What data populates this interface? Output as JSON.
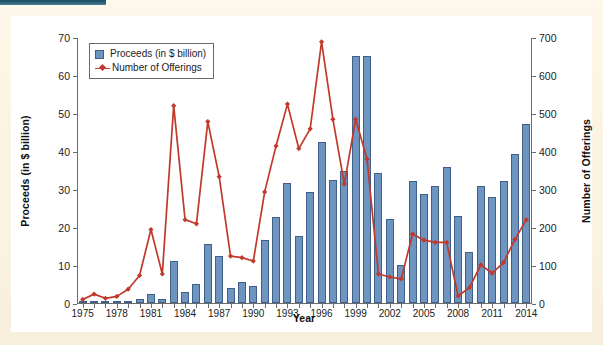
{
  "figure": {
    "background_color": "#ffffff",
    "page_background_color": "#fbf5e4",
    "top_tab_color": "#1d4e60"
  },
  "legend": {
    "position": "top-left-inside",
    "entries": [
      {
        "label": "Proceeds (in $ billion)",
        "marker": "bar-swatch",
        "color": "#6e94c0"
      },
      {
        "label": "Number of Offerings",
        "marker": "line-with-diamond",
        "color": "#c0392b"
      }
    ]
  },
  "axis_titles": {
    "left": "Proceeds (in $ billion)",
    "right": "Number of Offerings",
    "bottom": "Year"
  },
  "left_axis": {
    "ticks": [
      0,
      10,
      20,
      30,
      40,
      50,
      60,
      70
    ],
    "tick_labels": [
      "0",
      "10",
      "20",
      "30",
      "40",
      "50",
      "60",
      "70"
    ],
    "min": 0,
    "max": 70
  },
  "right_axis": {
    "ticks": [
      0,
      100,
      200,
      300,
      400,
      500,
      600,
      700
    ],
    "tick_labels": [
      "0",
      "100",
      "200",
      "300",
      "400",
      "500",
      "600",
      "700"
    ],
    "min": 0,
    "max": 700
  },
  "x_axis": {
    "tick_labels": [
      "1975",
      "1978",
      "1981",
      "1984",
      "1987",
      "1990",
      "1993",
      "1996",
      "1999",
      "2002",
      "2005",
      "2008",
      "2011",
      "2014"
    ],
    "label_every": 3,
    "min": 1975,
    "max": 2014
  },
  "chart_data": {
    "type": "bar",
    "title": "",
    "subtitle": "",
    "xlabel": "Year",
    "ylabel": "Proceeds (in $ billion)",
    "ylabel_secondary": "Number of Offerings",
    "ylim": [
      0,
      70
    ],
    "ylim_secondary": [
      0,
      700
    ],
    "grid": false,
    "legend_position": "upper left",
    "categories": [
      1975,
      1976,
      1977,
      1978,
      1979,
      1980,
      1981,
      1982,
      1983,
      1984,
      1985,
      1986,
      1987,
      1988,
      1989,
      1990,
      1991,
      1992,
      1993,
      1994,
      1995,
      1996,
      1997,
      1998,
      1999,
      2000,
      2001,
      2002,
      2003,
      2004,
      2005,
      2006,
      2007,
      2008,
      2009,
      2010,
      2011,
      2012,
      2013,
      2014
    ],
    "series": [
      {
        "name": "Proceeds (in $ billion)",
        "type": "bar",
        "axis": "left",
        "color": "#6e94c0",
        "edge_color": "#3d5f88",
        "values": [
          0.2,
          0.3,
          0.2,
          0.2,
          0.4,
          1.0,
          2.4,
          1.0,
          11.1,
          2.8,
          5.0,
          15.6,
          12.3,
          3.9,
          5.4,
          4.5,
          16.5,
          22.6,
          31.5,
          17.6,
          29.1,
          42.5,
          32.4,
          34.8,
          65.0,
          65.0,
          34.3,
          22.1,
          10.1,
          32.0,
          28.7,
          30.8,
          35.9,
          22.8,
          13.3,
          30.8,
          28.0,
          32.1,
          39.3,
          47.2
        ]
      },
      {
        "name": "Number of Offerings",
        "type": "line",
        "axis": "right",
        "color": "#c0392b",
        "marker": "diamond",
        "values": [
          12,
          26,
          15,
          20,
          39,
          75,
          196,
          79,
          522,
          222,
          211,
          480,
          335,
          126,
          122,
          113,
          295,
          416,
          526,
          409,
          461,
          690,
          486,
          316,
          486,
          381,
          79,
          71,
          66,
          184,
          168,
          162,
          162,
          21,
          43,
          103,
          81,
          109,
          170,
          222
        ]
      }
    ]
  }
}
